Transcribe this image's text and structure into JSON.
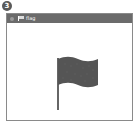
{
  "step_badge": "3",
  "window": {
    "title": "flag",
    "app_icon": "flag-app-icon",
    "titlebar_color": "#6b6b6b"
  },
  "content": {
    "graphic": "flag-icon",
    "flag_color": "#555555",
    "pole_color": "#666666"
  }
}
